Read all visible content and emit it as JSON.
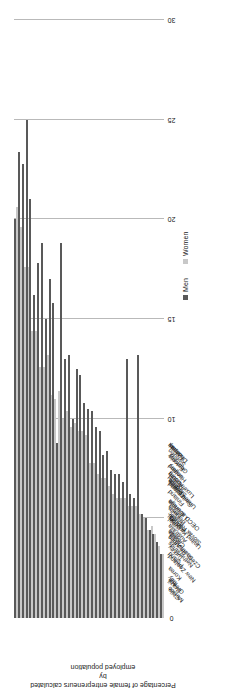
{
  "legend": {
    "items": [
      {
        "label": "Men",
        "color": "#595959",
        "name": "legend-men"
      },
      {
        "label": "Women",
        "color": "#c8c8c8",
        "name": "legend-women"
      }
    ]
  },
  "axis": {
    "value_title_line1": "Percentage of female entrepreneurs calculated by",
    "value_title_line2": "employed population",
    "ticks": [
      "0",
      "5",
      "10",
      "15",
      "20",
      "25",
      "30"
    ]
  },
  "chart_data": {
    "type": "bar",
    "orientation": "horizontal",
    "title": "",
    "xlabel": "",
    "ylabel": "Percentage of female entrepreneurs calculated by employed population",
    "ylim": [
      0,
      30
    ],
    "grid": true,
    "legend_position": "top-right",
    "categories": [
      "Mexico",
      "Chile",
      "Greece",
      "Brazil",
      "New Zealand",
      "Italy",
      "Korea",
      "Czech Republic",
      "Netherlands",
      "Poland",
      "South Africa",
      "Turkey",
      "United Kingdom",
      "Slovak Republic",
      "Canada",
      "Australia",
      "Spain",
      "OECD average",
      "Portugal",
      "Israel",
      "Belgium",
      "Lithuania",
      "Latvia",
      "United States",
      "Switzerland",
      "Finland",
      "Luxembourg",
      "Slovenia",
      "France",
      "Iceland",
      "Austria",
      "Hungary",
      "Ireland",
      "Germany",
      "Estonia",
      "Sweden",
      "Denmark",
      "Norway",
      "Japan"
    ],
    "series": [
      {
        "name": "Men",
        "color": "#595959",
        "values": [
          20.0,
          23.4,
          22.8,
          25.0,
          21.0,
          16.2,
          17.8,
          18.8,
          15.0,
          17.0,
          15.8,
          8.8,
          18.8,
          13.0,
          13.2,
          10.0,
          12.5,
          12.2,
          10.8,
          10.5,
          10.4,
          9.6,
          9.4,
          8.2,
          8.4,
          7.4,
          7.2,
          7.2,
          6.8,
          13.0,
          6.2,
          6.0,
          13.2,
          5.2,
          5.0,
          4.4,
          4.2,
          3.8,
          3.2
        ]
      },
      {
        "name": "Women",
        "color": "#c8c8c8",
        "values": [
          20.6,
          19.6,
          17.6,
          17.6,
          14.4,
          14.4,
          12.6,
          12.6,
          13.2,
          11.2,
          11.0,
          11.4,
          10.0,
          10.4,
          9.6,
          9.8,
          9.4,
          9.4,
          9.2,
          7.8,
          7.8,
          7.2,
          7.0,
          7.0,
          6.6,
          6.2,
          6.0,
          6.0,
          6.0,
          5.6,
          5.6,
          5.6,
          5.2,
          5.0,
          4.4,
          4.6,
          4.2,
          3.6,
          3.2
        ]
      }
    ]
  }
}
